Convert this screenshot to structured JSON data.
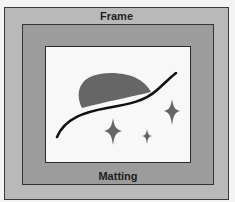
{
  "diagram": {
    "labels": {
      "frame": "Frame",
      "matting": "Matting"
    },
    "colors": {
      "frame_fill": "#b9b9b9",
      "mat_fill": "#9c9c9c",
      "picture_fill": "#f8f8f8",
      "artwork_shape": "#666666",
      "artwork_line": "#111111",
      "outline": "#333333"
    },
    "artwork": {
      "elements": [
        "blob",
        "curve",
        "star-large",
        "star-small",
        "star-tall"
      ]
    }
  }
}
